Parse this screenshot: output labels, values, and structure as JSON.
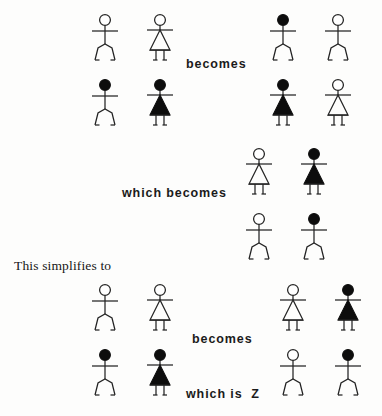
{
  "page": {
    "background_color": "#fdfdfc",
    "ink_color": "#1a1a1a",
    "width": 382,
    "height": 416
  },
  "labels": {
    "becomes_top": "becomes",
    "which_becomes": "which becomes",
    "this_simplifies_to": "This simplifies to",
    "becomes_bottom": "becomes",
    "which_is_z": "which is  Z"
  },
  "figure_types": {
    "open_male": "open-head-male-stick-figure",
    "filled_male": "filled-head-male-stick-figure",
    "open_female": "open-head-female-stick-figure",
    "filled_female": "filled-head-female-stick-figure"
  },
  "groups": {
    "top_left": {
      "name": "top-left-figure-group",
      "figures": [
        "open_male",
        "open_female",
        "filled_male",
        "filled_female"
      ]
    },
    "top_right": {
      "name": "top-right-figure-group",
      "figures": [
        "filled_male",
        "open_male",
        "filled_female",
        "open_female"
      ]
    },
    "middle": {
      "name": "middle-figure-group",
      "figures": [
        "open_female",
        "filled_female",
        "open_male",
        "filled_male"
      ]
    },
    "bottom_left": {
      "name": "bottom-left-figure-group",
      "figures": [
        "open_male",
        "open_female",
        "filled_male",
        "filled_female"
      ]
    },
    "bottom_right": {
      "name": "bottom-right-figure-group",
      "figures": [
        "open_female",
        "filled_female",
        "open_male",
        "filled_male"
      ]
    }
  }
}
